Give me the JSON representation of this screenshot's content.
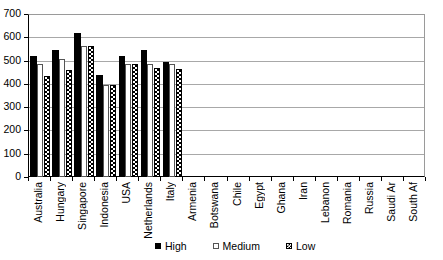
{
  "chart_data": {
    "type": "bar",
    "title": "",
    "subtitle": "",
    "xlabel": "",
    "ylabel": "",
    "ylim": [
      0,
      700
    ],
    "ytick_labels": [
      "700",
      "600",
      "500",
      "400",
      "300",
      "200",
      "100",
      "0"
    ],
    "ytick_values": [
      700,
      600,
      500,
      400,
      300,
      200,
      100,
      0
    ],
    "grid": true,
    "legend_position": "bottom",
    "categories": [
      "Australia",
      "Hungary",
      "Singapore",
      "Indonesia",
      "USA",
      "Netherlands",
      "Italy",
      "Armenia",
      "Botswana",
      "Chile",
      "Egypt",
      "Ghana",
      "Iran",
      "Lebanon",
      "Romania",
      "Russia",
      "Saudi Ar",
      "South Af"
    ],
    "series": [
      {
        "name": "High",
        "pattern": "solid-black",
        "color": "#000000",
        "values": [
          525,
          550,
          622,
          442,
          523,
          548,
          498,
          null,
          null,
          null,
          null,
          null,
          null,
          null,
          null,
          null,
          null,
          null
        ]
      },
      {
        "name": "Medium",
        "pattern": "white-outline",
        "color": "#ffffff",
        "values": [
          490,
          508,
          565,
          398,
          487,
          487,
          487,
          null,
          null,
          null,
          null,
          null,
          null,
          null,
          null,
          null,
          null,
          null
        ]
      },
      {
        "name": "Low",
        "pattern": "checker",
        "color": "#000000",
        "values": [
          437,
          462,
          565,
          398,
          487,
          470,
          468,
          null,
          null,
          null,
          null,
          null,
          null,
          null,
          null,
          null,
          null,
          null
        ]
      }
    ]
  },
  "legend": {
    "items": [
      {
        "label": "High",
        "swatch": "high"
      },
      {
        "label": "Medium",
        "swatch": "medium"
      },
      {
        "label": "Low",
        "swatch": "low"
      }
    ]
  }
}
